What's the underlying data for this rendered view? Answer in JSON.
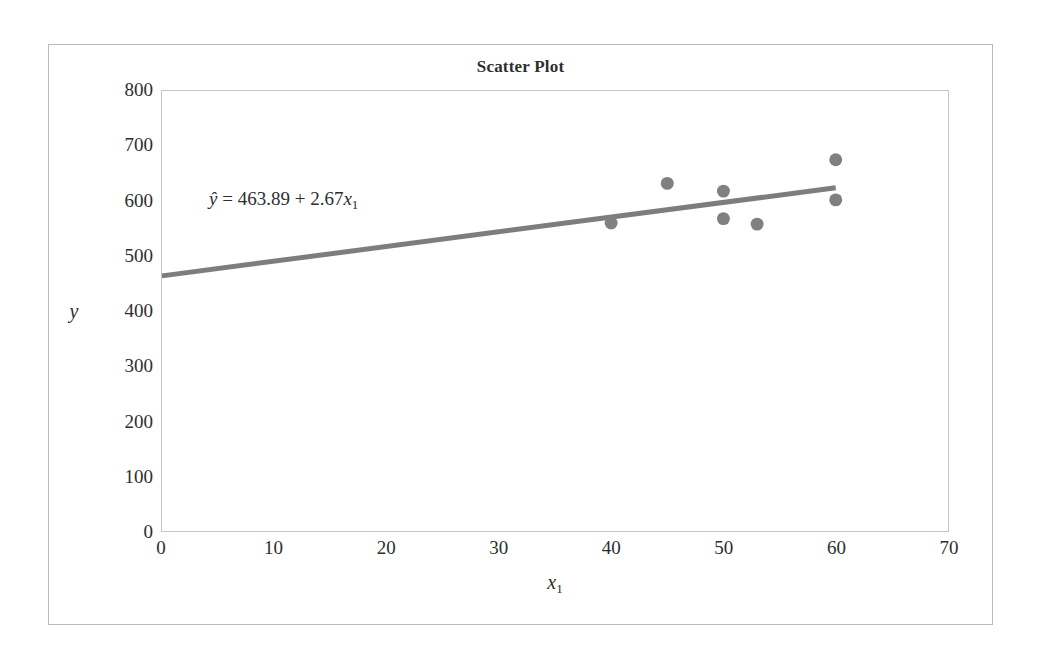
{
  "chart_data": {
    "type": "scatter",
    "title": "Scatter Plot",
    "xlabel": "x₁",
    "xlabel_base": "x",
    "xlabel_sub": "1",
    "ylabel": "y",
    "xlim": [
      0,
      70
    ],
    "ylim": [
      0,
      800
    ],
    "xticks": [
      0,
      10,
      20,
      30,
      40,
      50,
      60,
      70
    ],
    "yticks": [
      0,
      100,
      200,
      300,
      400,
      500,
      600,
      700,
      800
    ],
    "grid": false,
    "legend": "none",
    "points": [
      {
        "x": 40,
        "y": 560
      },
      {
        "x": 45,
        "y": 632
      },
      {
        "x": 50,
        "y": 618
      },
      {
        "x": 50,
        "y": 568
      },
      {
        "x": 53,
        "y": 558
      },
      {
        "x": 60,
        "y": 675
      },
      {
        "x": 60,
        "y": 602
      }
    ],
    "marker_color": "#808080",
    "marker_size": 13,
    "trendline": {
      "type": "linear-regression",
      "intercept": 463.89,
      "slope": 2.67,
      "x_start": 0,
      "x_end": 60,
      "color": "#7d7d7d",
      "width": 5
    },
    "annotations": [
      {
        "name": "regression-equation",
        "y_hat": "ŷ",
        "equals": "=",
        "intercept_text": "463.89",
        "plus": "+",
        "slope_text": "2.67",
        "x_var": "x",
        "x_sub": "1",
        "full_text": "ŷ = 463.89 + 2.67x₁"
      }
    ],
    "axis_color": "#c5c5c5",
    "frame_color": "#b9b9b9",
    "background": "#ffffff"
  }
}
